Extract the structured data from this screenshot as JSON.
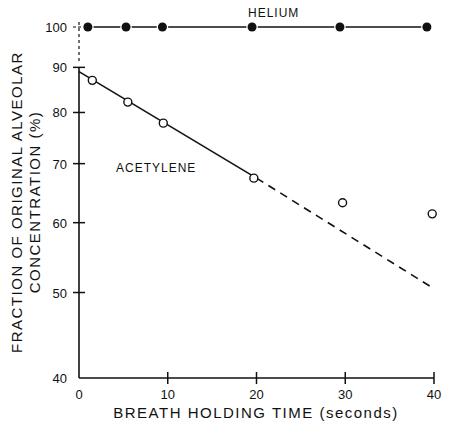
{
  "chart_data": {
    "type": "scatter",
    "title": "",
    "xlabel": "BREATH HOLDING TIME (seconds)",
    "ylabel_line1": "FRACTION OF ORIGINAL ALVEOLAR",
    "ylabel_line2": "CONCENTRATION (%)",
    "x_range": [
      0,
      40
    ],
    "y_range": [
      40,
      100
    ],
    "y_scale": "log",
    "grid": false,
    "x_ticks": [
      0,
      10,
      20,
      30,
      40
    ],
    "x_tick_labels": [
      "0",
      "10",
      "20",
      "30",
      "40"
    ],
    "y_ticks": [
      40,
      50,
      60,
      70,
      80,
      90,
      100
    ],
    "y_tick_labels": [
      "40",
      "50",
      "60",
      "70",
      "80",
      "90",
      "100"
    ],
    "series": [
      {
        "name": "HELIUM",
        "marker": "filled-circle",
        "line": "solid",
        "x": [
          1,
          5.3,
          9.4,
          19.5,
          29.4,
          39.2
        ],
        "y": [
          100,
          100,
          100,
          100,
          100,
          100
        ]
      },
      {
        "name": "ACETYLENE",
        "marker": "open-circle",
        "x": [
          1.5,
          5.5,
          9.5,
          19.7,
          29.7,
          39.8
        ],
        "y": [
          87,
          82.2,
          77.8,
          67.4,
          63.2,
          61.4
        ],
        "fit_line": {
          "solid_segment": {
            "x": [
              0,
              20
            ],
            "y": [
              89,
              67.4
            ]
          },
          "dashed_segment": {
            "x": [
              20,
              40
            ],
            "y": [
              67.4,
              50.5
            ]
          }
        }
      }
    ],
    "annotations": [
      {
        "text": "HELIUM",
        "near_series": "HELIUM",
        "placement": "above-line-center"
      },
      {
        "text": "ACETYLENE",
        "near_series": "ACETYLENE",
        "placement": "below-line-left"
      }
    ]
  }
}
